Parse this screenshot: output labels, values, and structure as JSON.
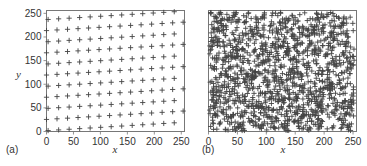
{
  "chart_data": [
    {
      "type": "scatter",
      "panel_label": "(a)",
      "title": "",
      "xlabel": "x",
      "ylabel": "y",
      "xlim": [
        0,
        256
      ],
      "ylim": [
        0,
        256
      ],
      "xticks": [
        "0",
        "50",
        "100",
        "150",
        "200",
        "250"
      ],
      "yticks": [
        "0",
        "50",
        "100",
        "150",
        "200",
        "250"
      ],
      "grid": false,
      "legend": null,
      "marker": "+",
      "description": "Regular slightly rotated lattice of points (~11 rows x ~13 columns)",
      "lattice": {
        "rows": 11,
        "cols": 14,
        "dx": 19.5,
        "dy": 23.5,
        "row_slope": 0.07,
        "x0": 3,
        "y0": 2
      }
    },
    {
      "type": "scatter",
      "panel_label": "(b)",
      "title": "",
      "xlabel": "x",
      "ylabel": "",
      "xlim": [
        0,
        256
      ],
      "ylim": [
        0,
        256
      ],
      "xticks": [
        "0",
        "50",
        "100",
        "150",
        "200",
        "250"
      ],
      "yticks": [],
      "grid": false,
      "legend": null,
      "marker": "+",
      "description": "Dense, irregular (random-like) cloud of points filling the square",
      "random_points": {
        "count": 1400,
        "seed": 7
      }
    }
  ],
  "colors": {
    "marker": "#444444",
    "axis": "#555555",
    "text": "#333333"
  }
}
